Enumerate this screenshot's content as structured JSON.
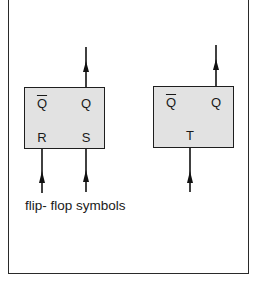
{
  "caption": "flip- flop symbols",
  "colors": {
    "box_fill": "#e2e2e2",
    "stroke": "#1e1e1e",
    "background": "#ffffff"
  },
  "rs_flipflop": {
    "outputs": {
      "q_bar": "Q",
      "q": "Q"
    },
    "inputs": {
      "r": "R",
      "s": "S"
    }
  },
  "t_flipflop": {
    "outputs": {
      "q_bar": "Q",
      "q": "Q"
    },
    "inputs": {
      "t": "T"
    }
  }
}
